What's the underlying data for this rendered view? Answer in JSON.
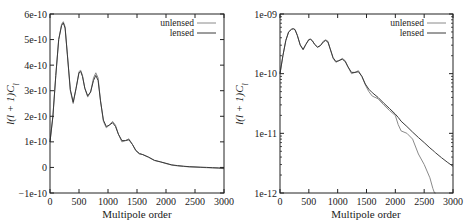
{
  "colors": {
    "unlensed": "#8a8a8a",
    "lensed": "#3a3a3a",
    "axis": "#222222"
  },
  "chart_data": [
    {
      "type": "line",
      "title": "",
      "xlabel": "Multipole order",
      "ylabel": "l(l+1)C_l",
      "xlim": [
        0,
        3000
      ],
      "ylim": [
        -1e-10,
        6e-10
      ],
      "yscale": "linear",
      "grid": false,
      "legend_position": "top-right",
      "x_ticks": [
        "0",
        "500",
        "1000",
        "1500",
        "2000",
        "2500",
        "3000"
      ],
      "y_ticks": [
        "-1e-10",
        "0",
        "1e-10",
        "2e-10",
        "3e-10",
        "4e-10",
        "5e-10",
        "6e-10"
      ],
      "x": [
        0,
        50,
        100,
        150,
        200,
        230,
        260,
        300,
        350,
        400,
        450,
        500,
        530,
        560,
        600,
        650,
        700,
        750,
        790,
        830,
        870,
        920,
        970,
        1020,
        1080,
        1130,
        1180,
        1240,
        1300,
        1360,
        1420,
        1480,
        1540,
        1600,
        1700,
        1800,
        1900,
        2000,
        2100,
        2200,
        2300,
        2400,
        2500,
        2600,
        2700,
        2800,
        2900,
        3000
      ],
      "series": [
        {
          "name": "unlensed",
          "values": [
            1e-10,
            2e-10,
            3.6e-10,
            5e-10,
            5.6e-10,
            5.7e-10,
            5.5e-10,
            4.4e-10,
            3e-10,
            2.5e-10,
            3.1e-10,
            3.75e-10,
            3.8e-10,
            3.6e-10,
            3.1e-10,
            2.75e-10,
            2.95e-10,
            3.5e-10,
            3.7e-10,
            3.5e-10,
            2.6e-10,
            1.8e-10,
            1.55e-10,
            1.65e-10,
            1.8e-10,
            1.65e-10,
            1.3e-10,
            1e-10,
            1.05e-10,
            1.12e-10,
            9e-11,
            6.5e-11,
            5.2e-11,
            5e-11,
            4e-11,
            2.7e-11,
            2.2e-11,
            1.5e-11,
            9e-12,
            6e-12,
            4e-12,
            2e-12,
            1e-12,
            0.0,
            -1e-12,
            -2e-12,
            -3e-12,
            -5e-12
          ]
        },
        {
          "name": "lensed",
          "values": [
            1e-10,
            2e-10,
            3.6e-10,
            5e-10,
            5.55e-10,
            5.65e-10,
            5.45e-10,
            4.4e-10,
            3.05e-10,
            2.55e-10,
            3.1e-10,
            3.7e-10,
            3.75e-10,
            3.55e-10,
            3.1e-10,
            2.8e-10,
            2.95e-10,
            3.4e-10,
            3.6e-10,
            3.4e-10,
            2.6e-10,
            1.85e-10,
            1.6e-10,
            1.65e-10,
            1.75e-10,
            1.6e-10,
            1.3e-10,
            1.05e-10,
            1.05e-10,
            1.08e-10,
            9e-11,
            6.7e-11,
            5.5e-11,
            5e-11,
            4e-11,
            2.8e-11,
            2.2e-11,
            1.6e-11,
            1e-11,
            7e-12,
            5e-12,
            3e-12,
            2e-12,
            1e-12,
            0.0,
            -1e-12,
            -2e-12,
            -3e-12
          ]
        }
      ]
    },
    {
      "type": "line",
      "title": "",
      "xlabel": "Multipole order",
      "ylabel": "l(l+1)C_l",
      "xlim": [
        0,
        3000
      ],
      "ylim": [
        1e-12,
        1e-09
      ],
      "yscale": "log",
      "grid": false,
      "legend_position": "top-right",
      "x_ticks": [
        "0",
        "500",
        "1000",
        "1500",
        "2000",
        "2500",
        "3000"
      ],
      "y_ticks": [
        "1e-12",
        "1e-11",
        "1e-10",
        "1e-09"
      ],
      "x": [
        0,
        50,
        100,
        150,
        200,
        230,
        260,
        300,
        350,
        400,
        450,
        500,
        530,
        560,
        600,
        650,
        700,
        750,
        790,
        830,
        870,
        920,
        970,
        1020,
        1080,
        1130,
        1180,
        1240,
        1300,
        1360,
        1420,
        1480,
        1540,
        1600,
        1700,
        1800,
        1900,
        2000,
        2050,
        2100,
        2200,
        2300,
        2400,
        2500,
        2600,
        2650,
        2680,
        2700,
        2800,
        2900,
        3000
      ],
      "series": [
        {
          "name": "unlensed",
          "values": [
            1e-10,
            2e-10,
            3.6e-10,
            5e-10,
            5.6e-10,
            5.7e-10,
            5.5e-10,
            4.4e-10,
            3e-10,
            2.5e-10,
            3.1e-10,
            3.75e-10,
            3.8e-10,
            3.6e-10,
            3.1e-10,
            2.75e-10,
            2.95e-10,
            3.5e-10,
            3.7e-10,
            3.5e-10,
            2.6e-10,
            1.8e-10,
            1.55e-10,
            1.65e-10,
            1.8e-10,
            1.65e-10,
            1.3e-10,
            1e-10,
            1.05e-10,
            1.12e-10,
            9e-11,
            6.5e-11,
            5e-11,
            4.2e-11,
            3.8e-11,
            3e-11,
            2.4e-11,
            2e-11,
            1.4e-11,
            1.1e-11,
            1e-11,
            8e-12,
            4.5e-12,
            3e-12,
            1.8e-12,
            1.2e-12,
            1e-12,
            null,
            null,
            null,
            null
          ]
        },
        {
          "name": "lensed",
          "values": [
            1e-10,
            2e-10,
            3.6e-10,
            5e-10,
            5.55e-10,
            5.65e-10,
            5.45e-10,
            4.4e-10,
            3.05e-10,
            2.55e-10,
            3.1e-10,
            3.7e-10,
            3.75e-10,
            3.55e-10,
            3.1e-10,
            2.8e-10,
            2.95e-10,
            3.4e-10,
            3.6e-10,
            3.4e-10,
            2.6e-10,
            1.85e-10,
            1.6e-10,
            1.65e-10,
            1.75e-10,
            1.6e-10,
            1.3e-10,
            1.05e-10,
            1.05e-10,
            1.08e-10,
            9e-11,
            6.7e-11,
            5.5e-11,
            4.8e-11,
            4e-11,
            3.2e-11,
            2.6e-11,
            2.1e-11,
            1.85e-11,
            1.6e-11,
            1.3e-11,
            1.05e-11,
            8.5e-12,
            7e-12,
            5.7e-12,
            5.2e-12,
            4.9e-12,
            4.7e-12,
            3.9e-12,
            3.3e-12,
            2.8e-12
          ]
        }
      ]
    }
  ],
  "panels": [
    {
      "ylabel": "l(l + 1)C",
      "ylabel_sub": "l",
      "xlabel": "Multipole order",
      "x_ticks": [
        "0",
        "500",
        "1000",
        "1500",
        "2000",
        "2500",
        "3000"
      ],
      "y_ticks": [
        "6e-10",
        "5e-10",
        "4e-10",
        "3e-10",
        "2e-10",
        "1e-10",
        "0",
        "−1e-10"
      ],
      "legend": [
        "unlensed",
        "lensed"
      ]
    },
    {
      "ylabel": "l(l + 1)C",
      "ylabel_sub": "l",
      "xlabel": "Multipole order",
      "x_ticks": [
        "0",
        "500",
        "1000",
        "1500",
        "2000",
        "2500",
        "3000"
      ],
      "y_ticks": [
        "1e-09",
        "1e-10",
        "1e-11",
        "1e-12"
      ],
      "legend": [
        "unlensed",
        "lensed"
      ]
    }
  ]
}
